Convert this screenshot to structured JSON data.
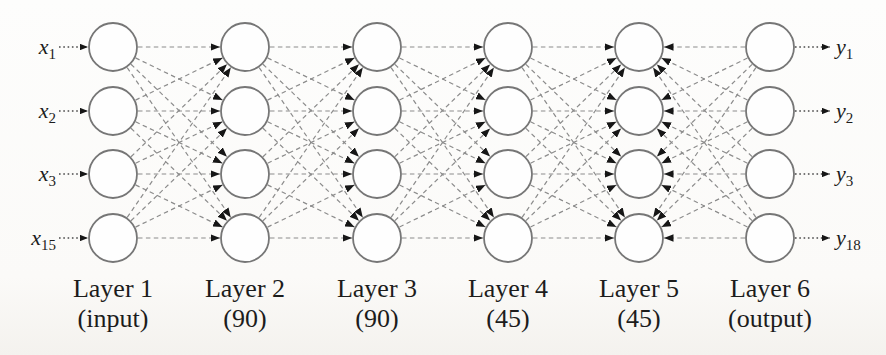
{
  "figure_title": "Feed-forward neural network architecture diagram",
  "style": {
    "node_fill": "#fefefe",
    "node_stroke": "#767676",
    "edge_color": "#8c8c8c",
    "io_edge_color": "#4a4a4a",
    "arrow_color": "#161616",
    "text_color": "#1c1c1c"
  },
  "diagram": {
    "type": "neural-network",
    "nodes_per_layer_shown": 4,
    "connectivity": "fully-connected between consecutive layers, dashed edges",
    "layers": [
      {
        "name": "layer-1",
        "label": "Layer 1",
        "sublabel": "(input)",
        "x": 113
      },
      {
        "name": "layer-2",
        "label": "Layer 2",
        "sublabel": "(90)",
        "x": 245
      },
      {
        "name": "layer-3",
        "label": "Layer 3",
        "sublabel": "(90)",
        "x": 377
      },
      {
        "name": "layer-4",
        "label": "Layer 4",
        "sublabel": "(45)",
        "x": 508
      },
      {
        "name": "layer-5",
        "label": "Layer 5",
        "sublabel": "(45)",
        "x": 639
      },
      {
        "name": "layer-6",
        "label": "Layer 6",
        "sublabel": "(output)",
        "x": 770
      }
    ],
    "layer_pairs": [
      {
        "a": 1,
        "b": 2,
        "arrow_into": 2
      },
      {
        "a": 2,
        "b": 3,
        "arrow_into": 3
      },
      {
        "a": 3,
        "b": 4,
        "arrow_into": 4
      },
      {
        "a": 4,
        "b": 5,
        "arrow_into": 5
      },
      {
        "a": 5,
        "b": 6,
        "arrow_into": 5
      }
    ],
    "inputs": [
      {
        "base": "x",
        "sub": "1"
      },
      {
        "base": "x",
        "sub": "2"
      },
      {
        "base": "x",
        "sub": "3"
      },
      {
        "base": "x",
        "sub": "15"
      }
    ],
    "outputs": [
      {
        "base": "y",
        "sub": "1"
      },
      {
        "base": "y",
        "sub": "2"
      },
      {
        "base": "y",
        "sub": "3"
      },
      {
        "base": "y",
        "sub": "18"
      }
    ],
    "layout": {
      "width": 886,
      "height": 355,
      "row_y": [
        47,
        111,
        174,
        238
      ],
      "node_radius": 24,
      "input_label_x": 56,
      "input_arrow_start_x": 59,
      "output_label_x": 836,
      "output_arrow_end_x": 830,
      "caption_y": 297,
      "subcaption_y": 327,
      "caption_font_size": 26,
      "io_label_font_size": 22,
      "io_sub_font_size": 15
    }
  }
}
